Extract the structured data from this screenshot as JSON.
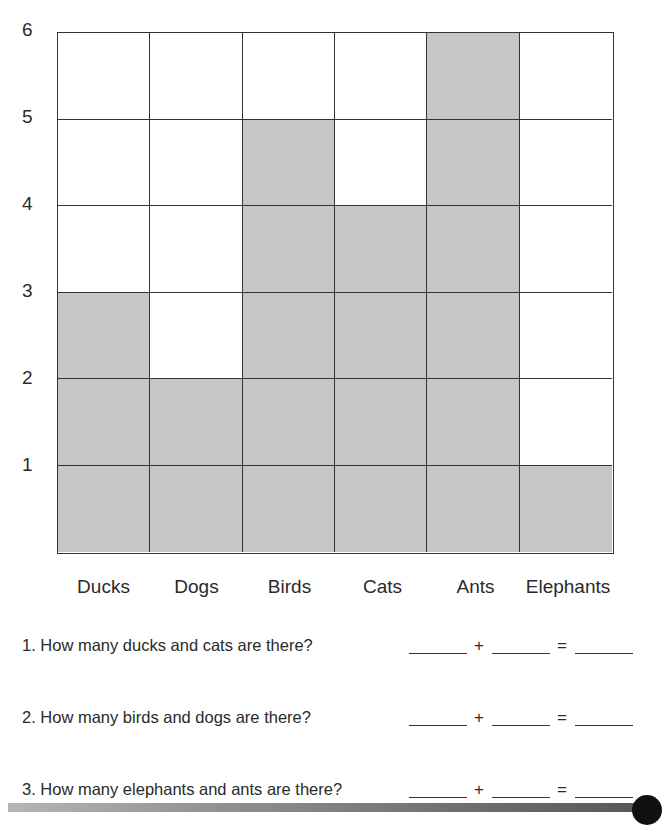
{
  "chart_data": {
    "type": "bar",
    "style": "pictograph grid (shaded squares)",
    "title": "",
    "xlabel": "",
    "ylabel": "",
    "categories": [
      "Ducks",
      "Dogs",
      "Birds",
      "Cats",
      "Ants",
      "Elephants"
    ],
    "values": [
      3,
      2,
      5,
      4,
      6,
      1
    ],
    "yticks": [
      1,
      2,
      3,
      4,
      5,
      6
    ],
    "ylim": [
      0,
      6
    ],
    "grid": true,
    "shade_color": "#c6c6c6"
  },
  "yaxis": {
    "labels": [
      "6",
      "5",
      "4",
      "3",
      "2",
      "1"
    ]
  },
  "xaxis": {
    "labels": [
      "Ducks",
      "Dogs",
      "Birds",
      "Cats",
      "Ants",
      "Elephants"
    ]
  },
  "questions": [
    {
      "text": "1. How many ducks and cats are there?",
      "plus": "+",
      "equals": "="
    },
    {
      "text": "2. How many birds and dogs are there?",
      "plus": "+",
      "equals": "="
    },
    {
      "text": "3. How many elephants and ants are there?",
      "plus": "+",
      "equals": "="
    }
  ]
}
